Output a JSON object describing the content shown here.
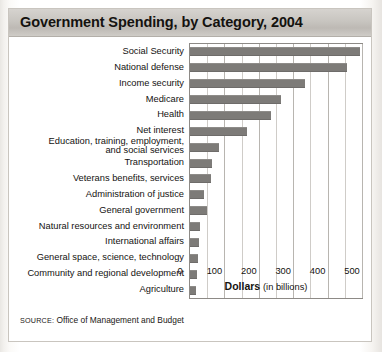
{
  "figure": {
    "title": "Government Spending, by Category, 2004",
    "source_prefix": "SOURCE:",
    "source_text": "Office of Management and Budget",
    "axis_title_main": "Dollars",
    "axis_title_sub": "(in billions)"
  },
  "colors": {
    "bar": "#7d7b78",
    "titlebar_top": "#d6d3cf",
    "titlebar_bottom": "#bdb9b4",
    "grid": "#cfccc8",
    "frame": "#8d8a86",
    "text": "#141210"
  },
  "chart_data": {
    "type": "bar",
    "orientation": "horizontal",
    "title": "Government Spending, by Category, 2004",
    "xlabel": "Dollars (in billions)",
    "ylabel": "",
    "xlim": [
      0,
      500
    ],
    "xticks": [
      0,
      100,
      200,
      300,
      400,
      500
    ],
    "xticklabels": [
      "0",
      "100",
      "200",
      "300",
      "400",
      "500"
    ],
    "gridline_interval": 50,
    "grid": true,
    "legend": false,
    "categories": [
      "Social Security",
      "National defense",
      "Income security",
      "Medicare",
      "Health",
      "Net interest",
      "Education, training, employment, and social services",
      "Transportation",
      "Veterans benefits, services",
      "Administration of justice",
      "General government",
      "Natural resources and environment",
      "International affairs",
      "General space, science, technology",
      "Community and regional development",
      "Agriculture"
    ],
    "values": [
      495,
      455,
      335,
      265,
      235,
      165,
      85,
      65,
      60,
      40,
      50,
      30,
      27,
      23,
      20,
      18
    ],
    "units": "billions of dollars"
  },
  "labels": [
    {
      "lines": [
        "Social Security"
      ]
    },
    {
      "lines": [
        "National defense"
      ]
    },
    {
      "lines": [
        "Income security"
      ]
    },
    {
      "lines": [
        "Medicare"
      ]
    },
    {
      "lines": [
        "Health"
      ]
    },
    {
      "lines": [
        "Net interest"
      ]
    },
    {
      "lines": [
        "Education, training, employment,",
        "and social services"
      ]
    },
    {
      "lines": [
        "Transportation"
      ]
    },
    {
      "lines": [
        "Veterans benefits, services"
      ]
    },
    {
      "lines": [
        "Administration of justice"
      ]
    },
    {
      "lines": [
        "General government"
      ]
    },
    {
      "lines": [
        "Natural resources and environment"
      ]
    },
    {
      "lines": [
        "International affairs"
      ]
    },
    {
      "lines": [
        "General space, science, technology"
      ]
    },
    {
      "lines": [
        "Community and regional development"
      ]
    },
    {
      "lines": [
        "Agriculture"
      ]
    }
  ]
}
